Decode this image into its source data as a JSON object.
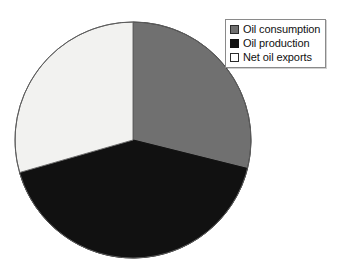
{
  "chart_data": {
    "type": "pie",
    "title": "",
    "subtitle": "",
    "xlabel": "",
    "ylabel": "",
    "grid": false,
    "legend_position": "top-right",
    "start_angle_deg": 0,
    "direction": "clockwise",
    "categories": [
      "Oil consumption",
      "Oil production",
      "Net oil exports"
    ],
    "values": [
      28.9,
      41.7,
      29.4
    ],
    "units": "percent",
    "slices": [
      {
        "label": "Oil consumption",
        "value": 28.9,
        "start_angle_deg": 0,
        "end_angle_deg": 104,
        "color": "#707070",
        "stroke": "#3a3a3a"
      },
      {
        "label": "Oil production",
        "value": 41.7,
        "start_angle_deg": 104,
        "end_angle_deg": 254,
        "color": "#111111",
        "stroke": "#111111"
      },
      {
        "label": "Net oil exports",
        "value": 29.4,
        "start_angle_deg": 254,
        "end_angle_deg": 360,
        "color": "#f2f2f0",
        "stroke": "#6e6e6e"
      }
    ],
    "geometry": {
      "center_x": 133,
      "center_y": 140,
      "radius": 118
    }
  },
  "legend": {
    "items": [
      {
        "label": "Oil consumption",
        "swatch_color": "#707070",
        "swatch_border": "#2b2b2b"
      },
      {
        "label": "Oil production",
        "swatch_color": "#111111",
        "swatch_border": "#111111"
      },
      {
        "label": "Net oil exports",
        "swatch_color": "#ffffff",
        "swatch_border": "#2b2b2b"
      }
    ]
  },
  "canvas": {
    "background": "#ffffff",
    "width": 352,
    "height": 272
  }
}
